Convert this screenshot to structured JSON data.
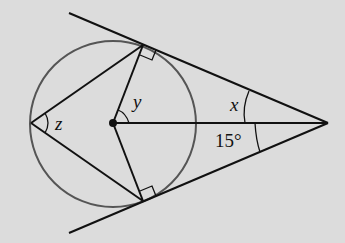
{
  "diagram": {
    "type": "circle-tangent-geometry",
    "labels": {
      "angle_x": "x",
      "angle_y": "y",
      "angle_z": "z",
      "angle_given": "15°"
    },
    "colors": {
      "background": "#dcdcdc",
      "circle": "#555555",
      "lines": "#111111"
    },
    "elements": {
      "circle": {
        "cx": 113,
        "cy": 123,
        "r": 83
      },
      "center_point": [
        113,
        123
      ],
      "external_point": [
        328,
        123
      ],
      "tangent_point_top": [
        143,
        45
      ],
      "tangent_point_bottom": [
        143,
        201
      ],
      "left_vertex": [
        31,
        123
      ]
    }
  }
}
